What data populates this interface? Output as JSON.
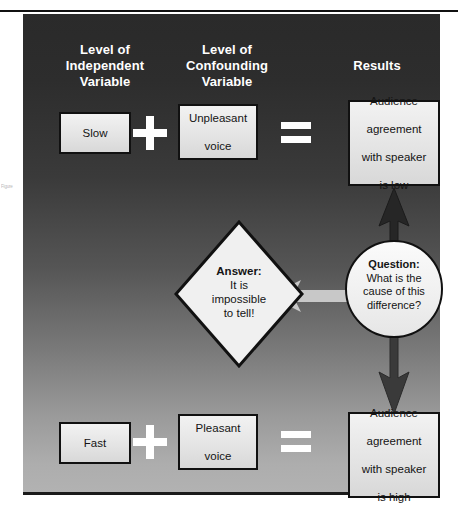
{
  "figure": {
    "margin_note": "Figure",
    "headings": {
      "independent_variable": "Level of\nIndependent\nVariable",
      "independent_variable_lines": [
        "Level of",
        "Independent",
        "Variable"
      ],
      "confounding_variable_lines": [
        "Level of",
        "Confounding",
        "Variable"
      ],
      "results": "Results"
    },
    "rows": {
      "top": {
        "independent_value": "Slow",
        "operator": "+",
        "confounding_value_lines": [
          "Unpleasant",
          "voice"
        ],
        "equals": "=",
        "result_lines": [
          "Audience",
          "agreement",
          "with speaker",
          "is low"
        ]
      },
      "bottom": {
        "independent_value": "Fast",
        "operator": "+",
        "confounding_value_lines": [
          "Pleasant",
          "voice"
        ],
        "equals": "=",
        "result_lines": [
          "Audience",
          "agreement",
          "with speaker",
          "is high"
        ]
      }
    },
    "question": {
      "lead": "Question:",
      "body_lines": [
        "What is the",
        "cause of this",
        "difference?"
      ]
    },
    "answer": {
      "lead": "Answer:",
      "body_lines": [
        "It is",
        "impossible",
        "to tell!"
      ]
    },
    "colors": {
      "panel_top": "#2a2a2a",
      "panel_bottom": "#b2b2b2",
      "box_fill": "#ececec",
      "box_border": "#111111",
      "glyph_white": "#ffffff",
      "arrow_dark": "#2b2b2b",
      "arrow_light": "#c6c6c6"
    },
    "icons": {
      "arrow_up": "arrow-up-icon",
      "arrow_down": "arrow-down-icon",
      "arrow_left": "arrow-left-icon",
      "plus": "plus-icon",
      "equals": "equals-icon"
    }
  }
}
